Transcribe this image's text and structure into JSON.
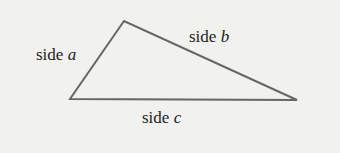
{
  "diagram": {
    "type": "triangle",
    "stroke_color": "#666666",
    "background_color": "#f1f1ef",
    "vertices": {
      "top": [
        124,
        21
      ],
      "left": [
        70,
        99
      ],
      "right": [
        297,
        100
      ]
    },
    "labels": {
      "a": {
        "word": "side",
        "var": "a"
      },
      "b": {
        "word": "side",
        "var": "b"
      },
      "c": {
        "word": "side",
        "var": "c"
      }
    }
  }
}
